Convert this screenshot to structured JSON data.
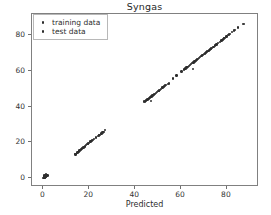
{
  "chart_data": {
    "type": "scatter",
    "title": "Syngas",
    "xlabel": "Predicted",
    "ylabel": "Actual",
    "xlim": [
      -5,
      94
    ],
    "ylim": [
      -5,
      92
    ],
    "xticks": [
      0,
      20,
      40,
      60,
      80
    ],
    "yticks": [
      0,
      20,
      40,
      60,
      80
    ],
    "xtick_labels": [
      "0",
      "20",
      "40",
      "60",
      "80"
    ],
    "ytick_labels": [
      "0",
      "20",
      "40",
      "60",
      "80"
    ],
    "grid": false,
    "legend_position": "upper left",
    "legend": [
      "training data",
      "test data"
    ],
    "marker_color": "#2b2b2b",
    "series": [
      {
        "name": "training data",
        "marker": "dot",
        "color": "#2b2b2b",
        "points": [
          [
            0.1,
            0.2
          ],
          [
            0.3,
            0.5
          ],
          [
            0.5,
            0.4
          ],
          [
            0.2,
            0.9
          ],
          [
            0.7,
            1.0
          ],
          [
            0.9,
            0.7
          ],
          [
            0.4,
            1.3
          ],
          [
            1.1,
            1.2
          ],
          [
            0.6,
            1.6
          ],
          [
            1.3,
            1.5
          ],
          [
            0.8,
            0.1
          ],
          [
            1.5,
            1.8
          ],
          [
            1.0,
            2.0
          ],
          [
            1.7,
            1.4
          ],
          [
            0.2,
            1.1
          ],
          [
            13.9,
            13.2
          ],
          [
            14.2,
            13.6
          ],
          [
            14.5,
            14.0
          ],
          [
            14.8,
            14.3
          ],
          [
            15.1,
            14.7
          ],
          [
            15.4,
            15.0
          ],
          [
            15.7,
            15.4
          ],
          [
            16.0,
            15.7
          ],
          [
            16.4,
            16.1
          ],
          [
            16.8,
            16.5
          ],
          [
            17.2,
            16.9
          ],
          [
            17.6,
            17.3
          ],
          [
            18.1,
            17.8
          ],
          [
            18.6,
            18.4
          ],
          [
            19.2,
            19.0
          ],
          [
            19.9,
            19.7
          ],
          [
            20.6,
            20.4
          ],
          [
            21.3,
            21.1
          ],
          [
            22.1,
            21.9
          ],
          [
            22.9,
            22.7
          ],
          [
            23.7,
            23.5
          ],
          [
            24.5,
            24.3
          ],
          [
            25.3,
            25.1
          ],
          [
            26.1,
            25.9
          ],
          [
            26.9,
            26.8
          ],
          [
            44.2,
            42.9
          ],
          [
            44.6,
            43.3
          ],
          [
            45.0,
            43.7
          ],
          [
            45.4,
            44.1
          ],
          [
            45.8,
            44.5
          ],
          [
            46.2,
            44.9
          ],
          [
            46.6,
            45.3
          ],
          [
            47.1,
            45.8
          ],
          [
            47.6,
            46.3
          ],
          [
            48.1,
            46.8
          ],
          [
            48.6,
            47.3
          ],
          [
            49.1,
            47.8
          ],
          [
            49.6,
            48.3
          ],
          [
            50.1,
            48.8
          ],
          [
            50.7,
            49.4
          ],
          [
            51.3,
            50.0
          ],
          [
            52.0,
            50.7
          ],
          [
            52.7,
            51.4
          ],
          [
            53.4,
            52.1
          ],
          [
            54.2,
            52.9
          ],
          [
            56.4,
            55.8
          ],
          [
            58.0,
            57.5
          ],
          [
            61.2,
            60.8
          ],
          [
            61.9,
            61.4
          ],
          [
            62.4,
            61.9
          ],
          [
            62.9,
            62.4
          ],
          [
            63.4,
            62.9
          ],
          [
            63.9,
            63.4
          ],
          [
            64.4,
            63.9
          ],
          [
            64.9,
            64.4
          ],
          [
            65.4,
            64.9
          ],
          [
            65.9,
            65.4
          ],
          [
            66.4,
            65.9
          ],
          [
            66.9,
            66.4
          ],
          [
            67.4,
            66.9
          ],
          [
            67.9,
            67.4
          ],
          [
            68.4,
            67.9
          ],
          [
            68.9,
            68.4
          ],
          [
            69.4,
            68.9
          ],
          [
            69.9,
            69.4
          ],
          [
            70.4,
            69.9
          ],
          [
            70.9,
            70.4
          ],
          [
            71.4,
            70.9
          ],
          [
            71.9,
            71.4
          ],
          [
            72.4,
            71.9
          ],
          [
            72.9,
            72.4
          ],
          [
            73.4,
            72.9
          ],
          [
            74.1,
            73.6
          ],
          [
            74.8,
            74.3
          ],
          [
            75.5,
            75.0
          ],
          [
            76.2,
            75.7
          ],
          [
            76.9,
            76.4
          ],
          [
            77.6,
            77.1
          ],
          [
            78.3,
            77.8
          ],
          [
            79.0,
            78.5
          ],
          [
            79.8,
            79.3
          ],
          [
            80.6,
            80.1
          ],
          [
            81.4,
            80.9
          ],
          [
            82.3,
            81.8
          ],
          [
            83.6,
            83.1
          ],
          [
            84.8,
            84.4
          ],
          [
            87.5,
            86.3
          ]
        ]
      },
      {
        "name": "test data",
        "marker": "dot",
        "color": "#303030",
        "points": [
          [
            0.4,
            0.7
          ],
          [
            1.2,
            0.8
          ],
          [
            0.9,
            1.4
          ],
          [
            1.6,
            1.1
          ],
          [
            0.3,
            1.8
          ],
          [
            14.0,
            13.4
          ],
          [
            14.6,
            13.9
          ],
          [
            15.9,
            15.6
          ],
          [
            17.4,
            17.1
          ],
          [
            19.5,
            19.3
          ],
          [
            21.7,
            21.5
          ],
          [
            24.1,
            23.9
          ],
          [
            25.7,
            25.5
          ],
          [
            43.9,
            43.0
          ],
          [
            46.9,
            43.3
          ],
          [
            47.8,
            46.5
          ],
          [
            50.4,
            49.1
          ],
          [
            53.1,
            51.8
          ],
          [
            54.8,
            53.1
          ],
          [
            60.2,
            59.7
          ],
          [
            65.1,
            61.2
          ],
          [
            62.2,
            61.6
          ],
          [
            73.2,
            72.6
          ],
          [
            78.8,
            78.2
          ],
          [
            81.0,
            80.5
          ],
          [
            83.2,
            82.7
          ],
          [
            86.9,
            86.4
          ]
        ]
      }
    ]
  },
  "axes": {
    "title": "Syngas",
    "x_axis_label": "Predicted",
    "y_axis_label": "Actual"
  },
  "legend": {
    "items": [
      {
        "label": "training data",
        "marker_name": "legend-marker-dot"
      },
      {
        "label": "test data",
        "marker_name": "legend-marker-dot"
      }
    ]
  }
}
